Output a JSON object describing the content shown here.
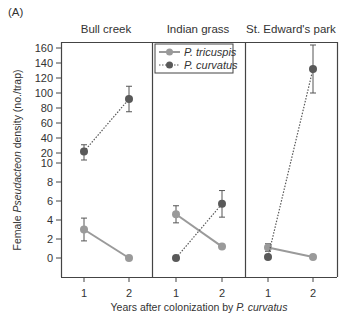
{
  "panel_tag": "(A)",
  "legend": {
    "items": [
      {
        "label": "P. tricuspis",
        "style": "solid",
        "color": "#9a9a9a"
      },
      {
        "label": "P. curvatus",
        "style": "dotted",
        "color": "#595959"
      }
    ]
  },
  "axes": {
    "ylabel_prefix": "Female ",
    "ylabel_italic": "Pseudacteon",
    "ylabel_suffix": " density (no./trap)",
    "xlabel_prefix": "Years after colonization by ",
    "xlabel_italic": "P. curvatus",
    "yticks_upper": [
      "160",
      "140",
      "120",
      "100",
      "80",
      "60",
      "40",
      "20",
      "10"
    ],
    "yticks_lower": [
      "8",
      "6",
      "4",
      "2",
      "0"
    ],
    "xticks": [
      "1",
      "2"
    ]
  },
  "chart_data": {
    "type": "line",
    "title": "(A)",
    "xlabel": "Years after colonization by P. curvatus",
    "ylabel": "Female Pseudacteon density (no./trap)",
    "y_axis": "broken: 0-10 linear lower segment, 10-160 upper segment",
    "yticks": [
      0,
      2,
      4,
      6,
      8,
      10,
      20,
      40,
      60,
      80,
      100,
      120,
      140,
      160
    ],
    "x": [
      1,
      2
    ],
    "panels": [
      {
        "name": "Bull creek",
        "series": [
          {
            "name": "P. tricuspis",
            "values": [
              3.0,
              0.0
            ],
            "errors": [
              1.2,
              0.0
            ]
          },
          {
            "name": "P. curvatus",
            "values": [
              22,
              92
            ],
            "errors": [
              9,
              17
            ]
          }
        ]
      },
      {
        "name": "Indian grass",
        "series": [
          {
            "name": "P. tricuspis",
            "values": [
              4.6,
              1.2
            ],
            "errors": [
              0.9,
              0.0
            ]
          },
          {
            "name": "P. curvatus",
            "values": [
              0.0,
              5.7
            ],
            "errors": [
              0.0,
              1.4
            ]
          }
        ]
      },
      {
        "name": "St. Edward's park",
        "series": [
          {
            "name": "P. tricuspis",
            "values": [
              1.1,
              0.1
            ],
            "errors": [
              0.4,
              0.0
            ]
          },
          {
            "name": "P. curvatus",
            "values": [
              0.1,
              132
            ],
            "errors": [
              0.0,
              32
            ]
          }
        ]
      }
    ],
    "legend_position": "inside top of middle panel",
    "grid": false
  },
  "panels": [
    {
      "name": "Bull creek"
    },
    {
      "name": "Indian grass"
    },
    {
      "name": "St. Edward's park"
    }
  ]
}
